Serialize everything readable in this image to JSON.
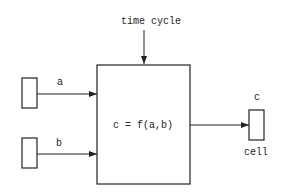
{
  "diagram": {
    "top_label": "time cycle",
    "formula": "c = f(a,b)",
    "inputs": [
      {
        "label": "a"
      },
      {
        "label": "b"
      }
    ],
    "output": {
      "label": "c",
      "caption": "cell"
    },
    "colors": {
      "stroke": "#222222",
      "background": "#ffffff"
    }
  }
}
